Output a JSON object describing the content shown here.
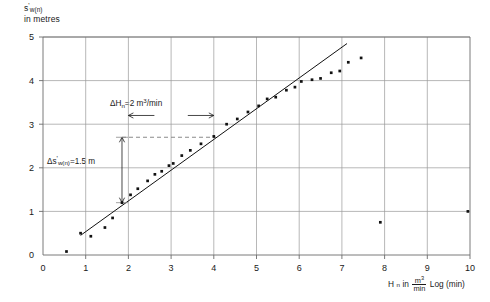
{
  "chart_data": {
    "type": "scatter",
    "title": "",
    "subtitle": "",
    "ylabel": "s'w(n) in metres",
    "ylabel_main": "s",
    "ylabel_prime": "'",
    "ylabel_sub": "w(n)",
    "ylabel_line2": "in metres",
    "xlabel": "Hn in m3/min   Log (min)",
    "xlabel_main": "H",
    "xlabel_sub": "n",
    "xlabel_in": "in",
    "xlabel_frac_num": "m",
    "xlabel_frac_num_sup": "3",
    "xlabel_frac_den": "min",
    "xlabel_tail": "Log (min)",
    "xlim": [
      0,
      10
    ],
    "ylim": [
      0,
      5
    ],
    "xticks": [
      0,
      1,
      2,
      3,
      4,
      5,
      6,
      7,
      8,
      9,
      10
    ],
    "xticklabels": [
      "0",
      "1",
      "2",
      "3",
      "4",
      "5",
      "6",
      "7",
      "8",
      "9",
      "10"
    ],
    "yticks": [
      0,
      1,
      2,
      3,
      4,
      5
    ],
    "yticklabels": [
      "0",
      "1",
      "2",
      "3",
      "4",
      "5"
    ],
    "grid": true,
    "grid_x": [
      1,
      2,
      3,
      4,
      5,
      6,
      7,
      8,
      9
    ],
    "grid_y": [
      1,
      2,
      3,
      4,
      5
    ],
    "legend": "none",
    "series": [
      {
        "name": "measurements",
        "marker": "square",
        "points": [
          [
            0.55,
            0.08
          ],
          [
            0.88,
            0.5
          ],
          [
            1.12,
            0.43
          ],
          [
            1.45,
            0.63
          ],
          [
            1.63,
            0.85
          ],
          [
            1.85,
            1.2
          ],
          [
            2.05,
            1.38
          ],
          [
            2.22,
            1.52
          ],
          [
            2.45,
            1.7
          ],
          [
            2.62,
            1.85
          ],
          [
            2.78,
            1.92
          ],
          [
            2.95,
            2.05
          ],
          [
            3.05,
            2.1
          ],
          [
            3.25,
            2.28
          ],
          [
            3.45,
            2.4
          ],
          [
            3.7,
            2.55
          ],
          [
            4.0,
            2.72
          ],
          [
            4.3,
            3.0
          ],
          [
            4.55,
            3.12
          ],
          [
            4.8,
            3.28
          ],
          [
            5.05,
            3.42
          ],
          [
            5.25,
            3.58
          ],
          [
            5.45,
            3.62
          ],
          [
            5.7,
            3.78
          ],
          [
            5.9,
            3.85
          ],
          [
            6.05,
            3.98
          ],
          [
            6.3,
            4.02
          ],
          [
            6.5,
            4.05
          ],
          [
            6.75,
            4.18
          ],
          [
            6.95,
            4.22
          ],
          [
            7.15,
            4.42
          ],
          [
            7.45,
            4.52
          ],
          [
            7.9,
            0.75
          ],
          [
            9.95,
            1.0
          ]
        ]
      }
    ],
    "trendline": {
      "name": "fitted straight line",
      "x0": 0.88,
      "y0": 0.45,
      "x1": 7.12,
      "y1": 4.85,
      "slope": 0.75
    },
    "annotations": [
      {
        "id": "delta-h",
        "text": "ΔHn = 2 m3/min",
        "prefix": "ΔH",
        "sub": "n",
        "mid": "=2 m",
        "sup": "3",
        "tail": "/min",
        "x_start": 2.0,
        "x_end": 4.0,
        "y": 3.2,
        "style": "double-arrow-horizontal"
      },
      {
        "id": "delta-s",
        "text": "Δs'w(n) = 1.5 m",
        "prefix": "Δs",
        "prime": "'",
        "sub": "w(n)",
        "tail": "=1.5 m",
        "x": 1.85,
        "y_start": 1.2,
        "y_end": 2.7,
        "style": "double-arrow-vertical"
      },
      {
        "id": "dashed-guide",
        "style": "dashed-horizontal",
        "y": 2.7,
        "x_start": 1.85,
        "x_end": 4.05
      }
    ]
  },
  "colors": {
    "axis": "#6b6b6b",
    "grid": "#9a9a9a",
    "marker": "#111111",
    "trendline": "#111111",
    "text": "#1a1a1a",
    "dashed": "#8a8a8a",
    "background": "#ffffff"
  }
}
